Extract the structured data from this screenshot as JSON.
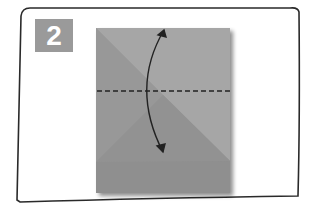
{
  "step": {
    "number": "2",
    "badge_color": "#9a9a9a"
  },
  "paper": {
    "color_light": "#a4a4a4",
    "color_mid": "#999999",
    "color_dark": "#8e8e8e",
    "fold_line": "valley-fold-horizontal-center"
  },
  "arrow": {
    "type": "fold-and-unfold",
    "color": "#222222"
  }
}
